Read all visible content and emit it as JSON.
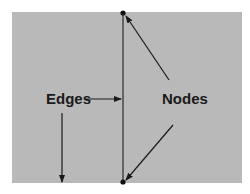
{
  "diagram": {
    "background_color": "#b9b9b9",
    "line_color": "#2a2a2a",
    "labels": {
      "edges": "Edges",
      "nodes": "Nodes"
    },
    "nodes": [
      {
        "id": "top",
        "x": 123,
        "y": 13
      },
      {
        "id": "bottom",
        "x": 123,
        "y": 182
      }
    ],
    "edges": [
      {
        "from": "top",
        "to": "bottom"
      }
    ]
  }
}
